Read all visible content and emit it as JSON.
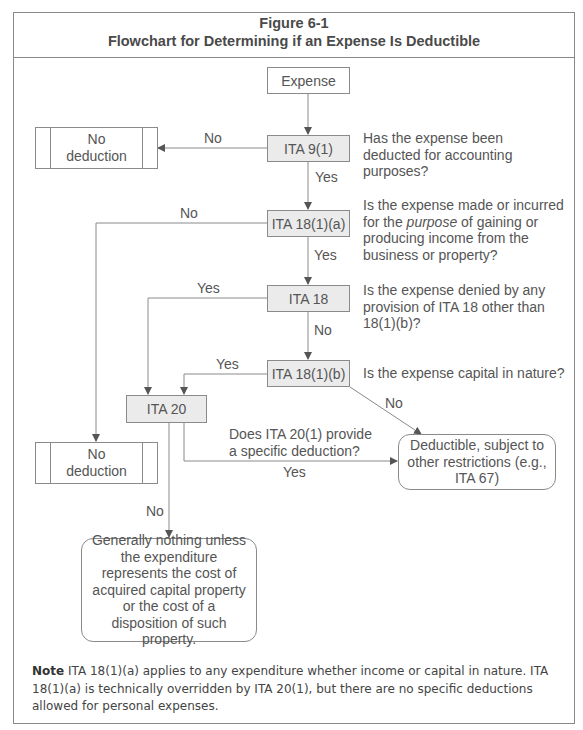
{
  "figure": {
    "number": "Figure 6-1",
    "title": "Flowchart for Determining if an Expense Is Deductible"
  },
  "nodes": {
    "expense": "Expense",
    "ita_9_1": "ITA 9(1)",
    "ita_18_1_a": "ITA 18(1)(a)",
    "ita_18": "ITA 18",
    "ita_18_1_b": "ITA 18(1)(b)",
    "ita_20": "ITA 20",
    "no_deduction_1": "No deduction",
    "no_deduction_2": "No deduction",
    "deductible": "Deductible, subject to other restrictions (e.g., ITA 67)",
    "generally_nothing": "Generally nothing unless the expenditure represents the cost of acquired capital property or the cost of a disposition of such property."
  },
  "questions": {
    "q_9_1": "Has the expense been deducted for accounting purposes?",
    "q_18_1_a_pre": "Is the expense made or incurred for the ",
    "q_18_1_a_em": "purpose",
    "q_18_1_a_post": " of gaining or producing income from the business or property?",
    "q_18": "Is the expense denied by any provision of ITA 18 other than 18(1)(b)?",
    "q_18_1_b": "Is the expense capital in nature?",
    "q_20_1": "Does ITA 20(1) provide a specific deduction?"
  },
  "edge_labels": {
    "ita_9_1_no": "No",
    "ita_9_1_yes": "Yes",
    "ita_18_1_a_no": "No",
    "ita_18_1_a_yes": "Yes",
    "ita_18_yes": "Yes",
    "ita_18_no": "No",
    "ita_18_1_b_yes": "Yes",
    "ita_18_1_b_no": "No",
    "ita_20_yes": "Yes",
    "ita_20_no": "No"
  },
  "note": {
    "label": "Note",
    "text": " ITA 18(1)(a) applies to any expenditure whether income or capital in nature. ITA 18(1)(a) is technically overridden by ITA 20(1), but there are no specific deductions allowed for personal expenses."
  },
  "colors": {
    "line": "#8a8a8a",
    "decision_fill": "#ebebeb",
    "text": "#555555"
  }
}
